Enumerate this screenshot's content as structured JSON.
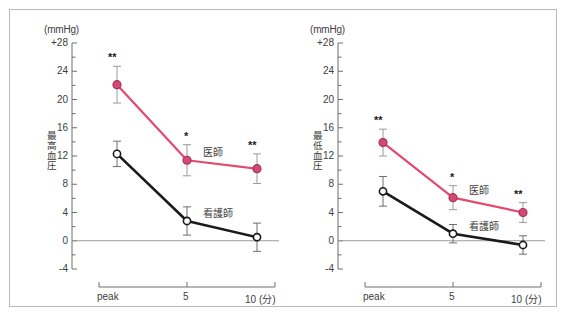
{
  "figure": {
    "unit_label": "(mmHg)",
    "x_tick_labels": [
      "peak",
      "5",
      "10 (分)"
    ],
    "y_tick_labels": [
      "+28",
      "24",
      "20",
      "16",
      "12",
      "8",
      "4",
      "0",
      "-4"
    ],
    "colors": {
      "doctor_line": "#e4486d",
      "nurse_line": "#1a1a1a",
      "axis": "#6e6e6e",
      "frame": "#b9b9b9",
      "text": "#3d3d3d"
    }
  },
  "chart_data": [
    {
      "type": "line",
      "title": "",
      "ylabel": "最高血圧",
      "xlabel": "",
      "unit": "(mmHg)",
      "x": [
        "peak",
        "5",
        "10"
      ],
      "xlabels": [
        "peak",
        "5",
        "10 (分)"
      ],
      "ylim": [
        -4,
        28
      ],
      "yticks": [
        -4,
        0,
        4,
        8,
        12,
        16,
        20,
        24,
        28
      ],
      "ytick_labels": [
        "-4",
        "0",
        "4",
        "8",
        "12",
        "16",
        "20",
        "24",
        "+28"
      ],
      "grid": false,
      "legend": "inline-annotations",
      "zero_line": true,
      "series": [
        {
          "name": "医師",
          "color": "#e4486d",
          "marker": "filled-circle",
          "values": [
            22.1,
            11.4,
            10.2
          ],
          "err_low": [
            2.6,
            2.2,
            2.1
          ],
          "err_high": [
            2.6,
            2.2,
            2.1
          ],
          "significance": [
            "**",
            "*",
            "**"
          ],
          "label_pos": {
            "x": "5",
            "dy": 2.0
          }
        },
        {
          "name": "看護師",
          "color": "#1a1a1a",
          "marker": "open-circle",
          "values": [
            12.3,
            2.8,
            0.5
          ],
          "err_low": [
            1.8,
            2.0,
            2.0
          ],
          "err_high": [
            1.8,
            2.0,
            2.0
          ],
          "significance": [
            "",
            "",
            ""
          ],
          "label_pos": {
            "x": "5",
            "dy": 2.0
          }
        }
      ]
    },
    {
      "type": "line",
      "title": "",
      "ylabel": "最低血圧",
      "xlabel": "",
      "unit": "(mmHg)",
      "x": [
        "peak",
        "5",
        "10"
      ],
      "xlabels": [
        "peak",
        "5",
        "10 (分)"
      ],
      "ylim": [
        -4,
        28
      ],
      "yticks": [
        -4,
        0,
        4,
        8,
        12,
        16,
        20,
        24,
        28
      ],
      "ytick_labels": [
        "-4",
        "0",
        "4",
        "8",
        "12",
        "16",
        "20",
        "24",
        "+28"
      ],
      "grid": false,
      "legend": "inline-annotations",
      "zero_line": true,
      "series": [
        {
          "name": "医師",
          "color": "#e4486d",
          "marker": "filled-circle",
          "values": [
            13.9,
            6.1,
            4.0
          ],
          "err_low": [
            1.9,
            1.7,
            1.4
          ],
          "err_high": [
            1.9,
            1.7,
            1.4
          ],
          "significance": [
            "**",
            "*",
            "**"
          ],
          "label_pos": {
            "x": "5",
            "dy": 2.0
          }
        },
        {
          "name": "看護師",
          "color": "#1a1a1a",
          "marker": "open-circle",
          "values": [
            7.0,
            1.0,
            -0.6
          ],
          "err_low": [
            2.1,
            1.3,
            1.3
          ],
          "err_high": [
            2.1,
            1.3,
            1.3
          ],
          "significance": [
            "",
            "",
            ""
          ],
          "label_pos": {
            "x": "5",
            "dy": 2.0
          }
        }
      ]
    }
  ]
}
